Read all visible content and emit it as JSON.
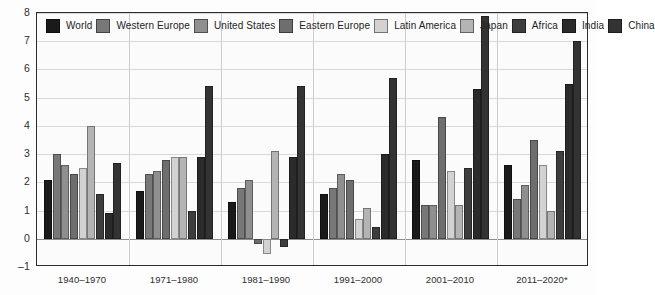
{
  "chart_data": {
    "type": "bar",
    "title": "",
    "subtitle": "",
    "xlabel": "",
    "ylabel": "",
    "ylim": [
      -1,
      8
    ],
    "yticks": [
      -1,
      0,
      1,
      2,
      3,
      4,
      5,
      6,
      7,
      8
    ],
    "ytick_labels": [
      "–1",
      "0",
      "1",
      "2",
      "3",
      "4",
      "5",
      "6",
      "7",
      "8"
    ],
    "grid": true,
    "legend_position": "top-left",
    "categories": [
      "1940–1970",
      "1971–1980",
      "1981–1990",
      "1991–2000",
      "2001–2010",
      "2011–2020*"
    ],
    "series": [
      {
        "name": "World",
        "color": "#1a1a1a",
        "values": [
          2.1,
          1.7,
          1.3,
          1.6,
          2.8,
          2.6
        ]
      },
      {
        "name": "Western Europe",
        "color": "#787878",
        "values": [
          3.0,
          2.3,
          1.8,
          1.8,
          1.2,
          1.4
        ]
      },
      {
        "name": "United States",
        "color": "#8f8f8f",
        "values": [
          2.6,
          2.4,
          2.1,
          2.3,
          1.2,
          1.9
        ]
      },
      {
        "name": "Eastern Europe",
        "color": "#6e6e6e",
        "values": [
          2.3,
          2.8,
          -0.2,
          2.1,
          4.3,
          3.5
        ]
      },
      {
        "name": "Latin America",
        "color": "#d2d2d2",
        "values": [
          2.5,
          2.9,
          -0.55,
          0.7,
          2.4,
          2.6
        ]
      },
      {
        "name": "Japan",
        "color": "#b4b4b4",
        "values": [
          4.0,
          2.9,
          3.1,
          1.1,
          1.2,
          1.0
        ]
      },
      {
        "name": "Africa",
        "color": "#3d3d3d",
        "values": [
          1.6,
          1.0,
          -0.3,
          0.4,
          2.5,
          3.1
        ]
      },
      {
        "name": "India",
        "color": "#2b2b2b",
        "values": [
          0.9,
          2.9,
          2.9,
          3.0,
          5.3,
          5.5
        ]
      },
      {
        "name": "China",
        "color": "#333333",
        "values": [
          2.7,
          5.4,
          5.4,
          5.7,
          7.9,
          7.0
        ]
      }
    ]
  },
  "legend": {
    "items": [
      {
        "label": "World",
        "swatch": "legend-swatch-world"
      },
      {
        "label": "Western Europe",
        "swatch": "legend-swatch-western-europe"
      },
      {
        "label": "United States",
        "swatch": "legend-swatch-united-states"
      },
      {
        "label": "Eastern Europe",
        "swatch": "legend-swatch-eastern-europe"
      },
      {
        "label": "Latin America",
        "swatch": "legend-swatch-latin-america"
      },
      {
        "label": "Japan",
        "swatch": "legend-swatch-japan"
      },
      {
        "label": "Africa",
        "swatch": "legend-swatch-africa"
      },
      {
        "label": "India",
        "swatch": "legend-swatch-india"
      },
      {
        "label": "China",
        "swatch": "legend-swatch-china"
      }
    ]
  },
  "axis_colors": {
    "frame": "#2b2b2b",
    "gridline": "#d8d8d8",
    "zeroline": "#8d8d8d",
    "text": "#2d2d2d",
    "background": "#fbfbfb"
  }
}
